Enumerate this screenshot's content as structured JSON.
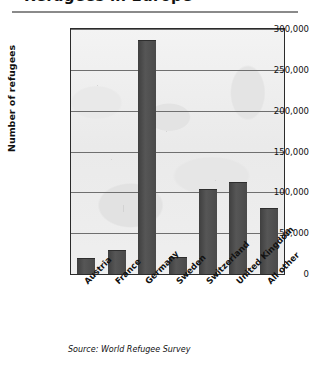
{
  "title": {
    "text": "Refugees in Europe",
    "cropped": true
  },
  "axis": {
    "y_title": "Number of refugees",
    "tick_labels": [
      "0",
      "50,000",
      "100,000",
      "150,000",
      "200,000",
      "250,000",
      "300,000"
    ]
  },
  "source": {
    "text": "Source: World Refugee Survey"
  },
  "colors": {
    "bar": "#4a4a4a",
    "plot_background": "#ededed",
    "gridline": "#6f6f6f",
    "frame": "#2b2b2b",
    "text": "#111111"
  },
  "chart_data": {
    "type": "bar",
    "title": "Refugees in Europe",
    "xlabel": "",
    "ylabel": "Number of refugees",
    "ylim": [
      0,
      300000
    ],
    "ytick_step": 50000,
    "yticks": [
      0,
      50000,
      100000,
      150000,
      200000,
      250000,
      300000
    ],
    "grid": true,
    "legend": null,
    "categories": [
      "Austria",
      "France",
      "Germany",
      "Sweden",
      "Switzerland",
      "United Kingdom",
      "All other"
    ],
    "values": [
      18000,
      28000,
      285000,
      20000,
      103000,
      111000,
      80000
    ],
    "source": "World Refugee Survey"
  }
}
